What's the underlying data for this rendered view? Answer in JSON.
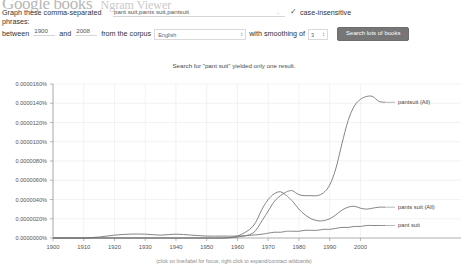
{
  "header": {
    "brand": "Google books",
    "product": "Ngram Viewer"
  },
  "form": {
    "phrases_label_line1": "Graph these comma-separated",
    "phrases_label_line2": "phrases:",
    "query_value": "pant suit,pants suit,pantsuit",
    "query_placeholder": "",
    "case_insensitive_label": "case-insensitive",
    "case_insensitive_checked": "✓",
    "dash": "-",
    "between_label": "between",
    "year_start": "1900",
    "and_label": "and",
    "year_end": "2008",
    "corpus_label": "from the corpus",
    "corpus_value": "English",
    "corpus_arrow": "↕",
    "smoothing_label": "with smoothing of",
    "smoothing_value": "3",
    "smoothing_arrow": "↕",
    "search_button_label": "Search lots of books"
  },
  "notice": {
    "text": "Search for \"pant suit\" yielded only one result."
  },
  "chart_footnote": {
    "text": "(click on line/label for focus, right click to expand/contract wildcards)"
  },
  "chart_data": {
    "type": "line",
    "title": "",
    "xlabel": "",
    "ylabel": "",
    "xlim": [
      1900,
      2008
    ],
    "ylim": [
      0,
      1.6e-05
    ],
    "grid": true,
    "legend_position": "right-inline",
    "xticks": [
      1900,
      1910,
      1920,
      1930,
      1940,
      1950,
      1960,
      1970,
      1980,
      1990,
      2000
    ],
    "xtick_labels": [
      "1900",
      "1910",
      "1920",
      "1930",
      "1940",
      "1950",
      "1960",
      "1970",
      "1980",
      "1990",
      "2000"
    ],
    "yticks": [
      0.0,
      2e-06,
      4e-06,
      6e-06,
      8e-06,
      1e-05,
      1.2e-05,
      1.4e-05,
      1.6e-05
    ],
    "ytick_labels": [
      "0.0000000%",
      "0.0000020%",
      "0.0000040%",
      "0.0000060%",
      "0.0000080%",
      "0.0000100%",
      "0.0000120%",
      "0.0000140%",
      "0.0000160%"
    ],
    "x": [
      1900,
      1905,
      1910,
      1915,
      1920,
      1925,
      1930,
      1935,
      1940,
      1945,
      1950,
      1955,
      1960,
      1965,
      1968,
      1970,
      1972,
      1974,
      1976,
      1977,
      1978,
      1980,
      1982,
      1984,
      1986,
      1988,
      1990,
      1992,
      1994,
      1996,
      1998,
      2000,
      2002,
      2004,
      2006,
      2008
    ],
    "series": [
      {
        "name": "pantsuit (All)",
        "label": "pantsuit (All)",
        "values": [
          0.0,
          0.0,
          0.0,
          0.0,
          0.0,
          0.0,
          0.0,
          0.0,
          0.0,
          0.0,
          0.0,
          0.0,
          1e-07,
          5e-07,
          1.8e-06,
          2.8e-06,
          3.8e-06,
          4.4e-06,
          4.8e-06,
          4.9e-06,
          4.9e-06,
          4.5e-06,
          4.4e-06,
          4.4e-06,
          4.4e-06,
          4.7e-06,
          5.5e-06,
          7.2e-06,
          9.8e-06,
          1.22e-05,
          1.37e-05,
          1.44e-05,
          1.47e-05,
          1.47e-05,
          1.42e-05,
          1.41e-05
        ]
      },
      {
        "name": "pants suit (All)",
        "label": "pants suit (All)",
        "values": [
          0.0,
          0.0,
          0.0,
          0.0,
          0.0,
          0.0,
          0.0,
          0.0,
          0.0,
          0.0,
          0.0,
          0.0,
          2e-07,
          1.2e-06,
          3e-06,
          4e-06,
          4.6e-06,
          4.8e-06,
          4.4e-06,
          4.1e-06,
          3.8e-06,
          3e-06,
          2.4e-06,
          2e-06,
          1.8e-06,
          1.8e-06,
          2e-06,
          2.4e-06,
          2.9e-06,
          3.2e-06,
          3.3e-06,
          3.1e-06,
          3e-06,
          3.1e-06,
          3.2e-06,
          3.2e-06
        ]
      },
      {
        "name": "pant suit",
        "label": "pant suit",
        "values": [
          0.0,
          0.0,
          0.0,
          1e-07,
          3e-07,
          4e-07,
          4e-07,
          3e-07,
          4e-07,
          3e-07,
          2e-07,
          2e-07,
          2e-07,
          3e-07,
          4e-07,
          5e-07,
          6e-07,
          6e-07,
          7e-07,
          7e-07,
          7e-07,
          7e-07,
          8e-07,
          8e-07,
          8e-07,
          9e-07,
          9e-07,
          1e-06,
          1.1e-06,
          1.1e-06,
          1.2e-06,
          1.2e-06,
          1.3e-06,
          1.3e-06,
          1.3e-06,
          1.3e-06
        ]
      }
    ]
  }
}
